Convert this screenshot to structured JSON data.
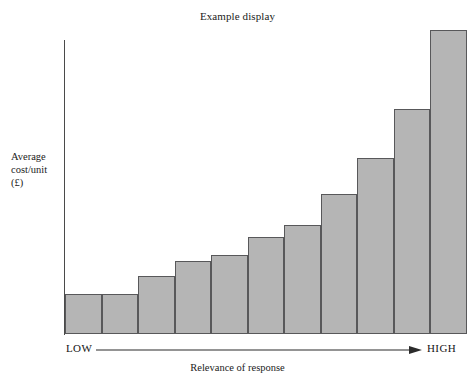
{
  "figure": {
    "title": "Example display",
    "y_axis_label_lines": [
      "Average",
      "cost/unit",
      "(£)"
    ],
    "x_axis_caption": "Relevance of response",
    "x_axis_low_label": "LOW",
    "x_axis_high_label": "HIGH"
  },
  "colors": {
    "bar_fill": "#b5b5b5",
    "bar_stroke": "#58585a",
    "axis": "#4a4a4a",
    "text": "#1b1b1b",
    "background": "#ffffff"
  },
  "chart_data": {
    "type": "bar",
    "title": "Example display",
    "xlabel": "Relevance of response",
    "ylabel": "Average cost/unit (£)",
    "grid": false,
    "legend": null,
    "axis_tick_labels": {
      "x": [
        "LOW",
        "HIGH"
      ],
      "y": []
    },
    "x_axis_direction_annotation": "LOW → HIGH (arrow)",
    "categories": [
      "1",
      "2",
      "3",
      "4",
      "5",
      "6",
      "7",
      "8",
      "9",
      "10",
      "11"
    ],
    "values": [
      13,
      13,
      19,
      24,
      26,
      32,
      36,
      46,
      58,
      74,
      100
    ],
    "ylim": [
      0,
      100
    ]
  }
}
